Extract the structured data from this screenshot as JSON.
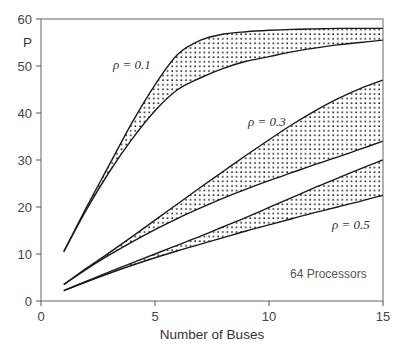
{
  "chart_data": {
    "type": "area",
    "title": "",
    "xlabel": "Number of Buses",
    "ylabel": "P",
    "xlim": [
      0,
      15
    ],
    "ylim": [
      0,
      60
    ],
    "xticks": [
      0,
      5,
      10,
      15
    ],
    "yticks": [
      0,
      10,
      20,
      30,
      40,
      50,
      60
    ],
    "grid": false,
    "legend": "none",
    "annotations": [
      {
        "text": "ρ = 0.1",
        "x": 3.5,
        "y": 53
      },
      {
        "text": "ρ = 0.3",
        "x": 9.3,
        "y": 40
      },
      {
        "text": "ρ = 0.5",
        "x": 13.2,
        "y": 20
      },
      {
        "text": "64 Processors",
        "x": 12.4,
        "y": 8
      }
    ],
    "x": [
      1,
      2,
      3,
      4,
      5,
      6,
      7,
      8,
      9,
      10,
      11,
      12,
      13,
      14,
      15
    ],
    "series": [
      {
        "name": "ρ = 0.1 upper bound",
        "group": "0.1",
        "bound": "upper",
        "values": [
          10.5,
          20,
          29,
          38,
          46,
          52.5,
          55.5,
          56.8,
          57.3,
          57.6,
          57.8,
          57.9,
          58,
          58,
          58
        ]
      },
      {
        "name": "ρ = 0.1 lower bound",
        "group": "0.1",
        "bound": "lower",
        "values": [
          10.5,
          19.5,
          27.5,
          34.5,
          40.5,
          45,
          47.5,
          49.5,
          51,
          52,
          53,
          53.8,
          54.5,
          55,
          55.5
        ]
      },
      {
        "name": "ρ = 0.3 upper bound",
        "group": "0.3",
        "bound": "upper",
        "values": [
          3.5,
          7,
          10.3,
          13.7,
          17.2,
          20.7,
          24.2,
          27.6,
          31,
          34.3,
          37.5,
          40.4,
          43,
          45.2,
          47
        ]
      },
      {
        "name": "ρ = 0.3 lower bound",
        "group": "0.3",
        "bound": "lower",
        "values": [
          3.5,
          6.8,
          9.8,
          12.6,
          15.2,
          17.6,
          19.8,
          21.9,
          23.8,
          25.6,
          27.3,
          29,
          30.6,
          32.3,
          34
        ]
      },
      {
        "name": "ρ = 0.5 upper bound",
        "group": "0.5",
        "bound": "upper",
        "values": [
          2.2,
          4.2,
          6.2,
          8.1,
          10,
          11.9,
          13.8,
          15.8,
          17.8,
          19.9,
          22,
          24.1,
          26.1,
          28.1,
          30
        ]
      },
      {
        "name": "ρ = 0.5 lower bound",
        "group": "0.5",
        "bound": "lower",
        "values": [
          2.2,
          4.1,
          5.9,
          7.6,
          9.2,
          10.7,
          12.1,
          13.5,
          14.9,
          16.2,
          17.5,
          18.8,
          20,
          21.2,
          22.5
        ]
      }
    ],
    "bands": [
      {
        "label": "ρ = 0.1",
        "upper": 0,
        "lower": 1
      },
      {
        "label": "ρ = 0.3",
        "upper": 2,
        "lower": 3
      },
      {
        "label": "ρ = 0.5",
        "upper": 4,
        "lower": 5
      }
    ],
    "colors": {
      "line": "#1a1a1a",
      "axis": "#555555",
      "dots": "#222222",
      "background": "#ffffff"
    }
  },
  "labels": {
    "xlabel": "Number of Buses",
    "ylabel": "P",
    "rho_01": "ρ = 0.1",
    "rho_03": "ρ = 0.3",
    "rho_05": "ρ = 0.5",
    "processors": "64 Processors"
  }
}
